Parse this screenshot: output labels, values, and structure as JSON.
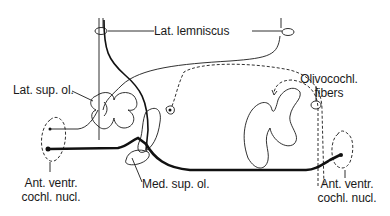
{
  "diagram": {
    "labels": {
      "lat_lemniscus": "Lat. lemniscus",
      "lat_sup_ol": "Lat. sup. ol.",
      "olivocochl_line1": "Olivocochl.",
      "olivocochl_line2": "fibers",
      "left_ant_line1": "Ant. ventr.",
      "left_ant_line2": "cochl. nucl.",
      "med_sup_ol": "Med. sup. ol.",
      "right_ant_line1": "Ant. ventr.",
      "right_ant_line2": "cochl. nucl."
    },
    "colors": {
      "ink": "#1a1a1a",
      "background": "#ffffff"
    }
  }
}
